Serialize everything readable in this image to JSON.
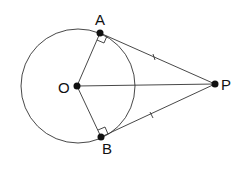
{
  "diagram": {
    "labels": {
      "A": "A",
      "B": "B",
      "O": "O",
      "P": "P"
    },
    "points": {
      "O": [
        77,
        86
      ],
      "A": [
        100,
        33
      ],
      "B": [
        101,
        137
      ],
      "P": [
        215,
        84
      ]
    },
    "circle": {
      "center": "O",
      "radius": 57
    },
    "segments": [
      [
        "O",
        "A"
      ],
      [
        "O",
        "B"
      ],
      [
        "O",
        "P"
      ],
      [
        "A",
        "P"
      ],
      [
        "B",
        "P"
      ]
    ],
    "right_angles": [
      "A",
      "B"
    ],
    "equal_tick_marks": [
      [
        "A",
        "P"
      ],
      [
        "B",
        "P"
      ]
    ],
    "colors": {
      "stroke": "#333333",
      "point": "#111111"
    }
  }
}
